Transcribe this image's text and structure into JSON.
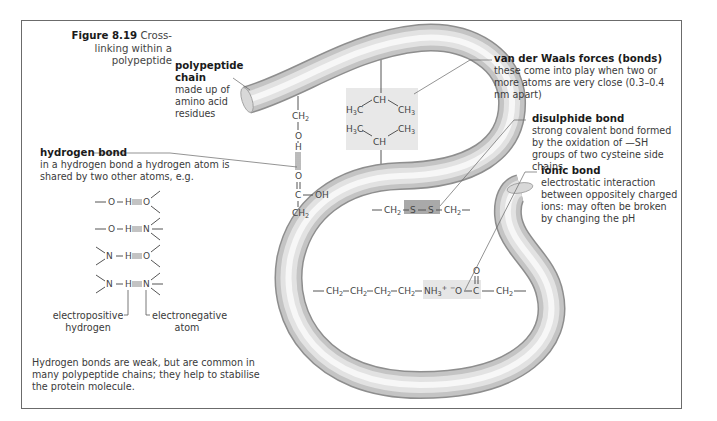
{
  "figure": {
    "number": "Figure 8.19",
    "caption": "Cross-linking within a polypeptide"
  },
  "labels": {
    "polypeptide_chain": {
      "title": "polypeptide chain",
      "text": "made up of amino acid residues"
    },
    "van_der_waals": {
      "title": "van der Waals forces (bonds)",
      "text": "these come into play when two or more atoms are very close (0.3–0.4 nm apart)"
    },
    "disulphide": {
      "title": "disulphide bond",
      "text": "strong covalent bond formed by the oxidation of —SH groups of two cysteine side chains"
    },
    "ionic": {
      "title": "ionic bond",
      "text": "electrostatic interaction between oppositely charged ions: may often be broken by changing the pH"
    },
    "hydrogen": {
      "title": "hydrogen bond",
      "text": "in a hydrogen bond a hydrogen atom is shared by two other atoms, e.g."
    },
    "electropositive": "electropositive hydrogen",
    "electronegative": "electronegative atom",
    "footnote": "Hydrogen bonds are weak, but are common in many polypeptide chains; they help to stabilise the protein molecule."
  },
  "hbond_examples": [
    {
      "left": "—O—H",
      "right": "O"
    },
    {
      "left": "—O—H",
      "right": "N"
    },
    {
      "left": "N—H",
      "right": "O"
    },
    {
      "left": "N—H",
      "right": "N"
    }
  ],
  "chemistry": {
    "hbond_side": [
      "CH2",
      "O",
      "H",
      "O",
      "C",
      "OH",
      "CH2"
    ],
    "vdw": [
      "CH",
      "H3C",
      "CH3",
      "H3C",
      "CH3",
      "CH"
    ],
    "disulphide": [
      "CH2",
      "S",
      "S",
      "CH2"
    ],
    "ionic": [
      "CH2",
      "CH2",
      "CH2",
      "CH2",
      "NH3+",
      "-O",
      "C",
      "O",
      "CH2"
    ]
  },
  "colors": {
    "frame": "#6b6b6b",
    "tube_light": "#f4f4f4",
    "tube_dark": "#a8a8a8",
    "highlight_box": "#e6e6e6",
    "disulphide_box": "#a9a9a9"
  }
}
